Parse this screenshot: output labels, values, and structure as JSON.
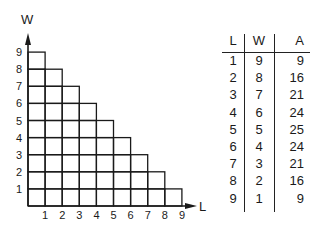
{
  "diagram": {
    "y_axis_label": "W",
    "x_axis_label": "L",
    "y_ticks": [
      "1",
      "2",
      "3",
      "4",
      "5",
      "6",
      "7",
      "8",
      "9"
    ],
    "x_ticks": [
      "1",
      "2",
      "3",
      "4",
      "5",
      "6",
      "7",
      "8",
      "9"
    ]
  },
  "table": {
    "headers": [
      "L",
      "W",
      "A"
    ],
    "rows": [
      [
        "1",
        "9",
        "9"
      ],
      [
        "2",
        "8",
        "16"
      ],
      [
        "3",
        "7",
        "21"
      ],
      [
        "4",
        "6",
        "24"
      ],
      [
        "5",
        "5",
        "25"
      ],
      [
        "6",
        "4",
        "24"
      ],
      [
        "7",
        "3",
        "21"
      ],
      [
        "8",
        "2",
        "16"
      ],
      [
        "9",
        "1",
        "9"
      ]
    ]
  },
  "colors": {
    "line": "#1a1a1a",
    "background": "#ffffff"
  }
}
